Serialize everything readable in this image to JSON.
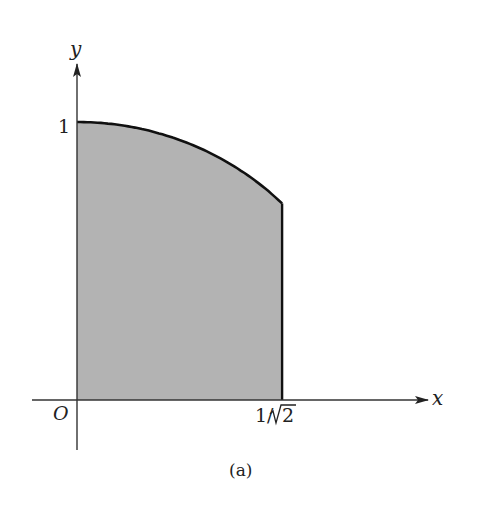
{
  "figure": {
    "caption": "(a)",
    "axes": {
      "x_label": "x",
      "y_label": "y",
      "origin_label": "O",
      "y_tick_label": "1",
      "x_tick_label_num": "1/",
      "x_tick_label_rad": "2"
    },
    "region": {
      "description": "Shaded region under the curve y = sqrt(1 - x^2) from x = 0 to x = 1/sqrt(2)",
      "x_min": 0,
      "x_max": 0.7071,
      "fill_color": "#b3b3b3",
      "edge_color": "#111111"
    }
  }
}
